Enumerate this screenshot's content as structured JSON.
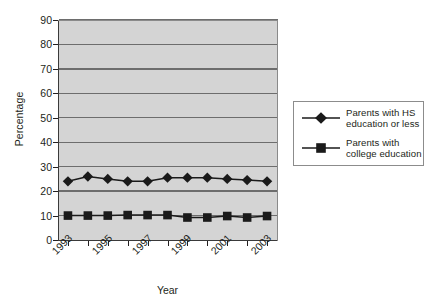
{
  "chart_data": {
    "type": "line",
    "title": "",
    "xlabel": "Year",
    "ylabel": "Percentage",
    "ylim": [
      0,
      90
    ],
    "ytick_step": 10,
    "yticks": [
      0,
      10,
      20,
      30,
      40,
      50,
      60,
      70,
      80,
      90
    ],
    "grid": true,
    "legend_position": "right",
    "x": [
      1993,
      1994,
      1995,
      1996,
      1997,
      1998,
      1999,
      2000,
      2001,
      2002,
      2003
    ],
    "categories": [
      "1993",
      "1994",
      "1995",
      "1996",
      "1997",
      "1998",
      "1999",
      "2000",
      "2001",
      "2002",
      "2003"
    ],
    "xtick_labels_shown": [
      "1993",
      "1995",
      "1997",
      "1999",
      "2001",
      "2003"
    ],
    "series": [
      {
        "name": "Parents with HS education or less",
        "name_line1": "Parents with HS",
        "name_line2": "education or less",
        "marker": "diamond",
        "color": "#1a1a1a",
        "values": [
          24,
          26,
          25,
          24,
          24,
          25.5,
          25.5,
          25.5,
          25,
          24.5,
          24
        ]
      },
      {
        "name": "Parents with college education",
        "name_line1": "Parents with",
        "name_line2": "college education",
        "marker": "square",
        "color": "#1a1a1a",
        "values": [
          10,
          10,
          10,
          10.2,
          10.2,
          10.2,
          9.2,
          9.2,
          9.8,
          9.2,
          9.8
        ]
      }
    ]
  },
  "axes": {
    "y_title": "Percentage",
    "x_title": "Year",
    "y_tick_labels": [
      "90",
      "80",
      "70",
      "60",
      "50",
      "40",
      "30",
      "20",
      "10",
      "0"
    ],
    "x_tick_labels": [
      "1993",
      "1995",
      "1997",
      "1999",
      "2001",
      "2003"
    ]
  },
  "legend": {
    "entries": [
      {
        "line1": "Parents with HS",
        "line2": "education or less",
        "marker": "diamond"
      },
      {
        "line1": "Parents with",
        "line2": "college education",
        "marker": "square"
      }
    ]
  },
  "colors": {
    "plot_background": "#d4d4d4",
    "gridline": "#6d6d6d",
    "axis": "#231f20",
    "series_marker": "#1a1a1a",
    "page_background": "#ffffff"
  }
}
